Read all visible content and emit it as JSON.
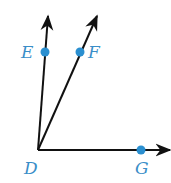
{
  "diagram": {
    "type": "angle-rays",
    "vertex": {
      "label": "D",
      "x": 38,
      "y": 150
    },
    "rays": [
      {
        "name": "ray-DE",
        "through": "E",
        "end": {
          "x": 48,
          "y": 16
        }
      },
      {
        "name": "ray-DF",
        "through": "F",
        "end": {
          "x": 97,
          "y": 16
        }
      },
      {
        "name": "ray-DG",
        "through": "G",
        "end": {
          "x": 170,
          "y": 150
        }
      }
    ],
    "points": [
      {
        "label": "E",
        "x": 45,
        "y": 52,
        "label_x": 21,
        "label_y": 58
      },
      {
        "label": "F",
        "x": 80,
        "y": 52,
        "label_x": 88,
        "label_y": 58
      },
      {
        "label": "G",
        "x": 141,
        "y": 150,
        "label_x": 135,
        "label_y": 174
      }
    ],
    "vertex_label": {
      "text": "D",
      "x": 24,
      "y": 174
    },
    "colors": {
      "line": "#111111",
      "point": "#2a8fd0",
      "label": "#3a8ec8"
    }
  }
}
